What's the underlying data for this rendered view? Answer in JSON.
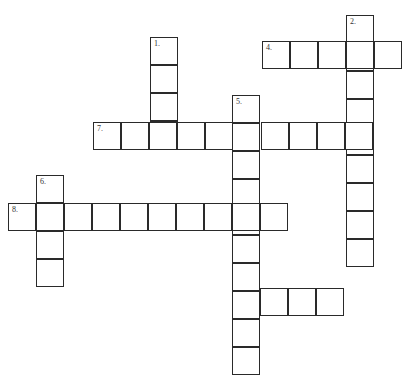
{
  "puzzle": {
    "type": "crossword",
    "cell_size": 28,
    "entries": [
      {
        "number": "1.",
        "direction": "down",
        "x": 150,
        "y": 37,
        "length": 4
      },
      {
        "number": "2.",
        "direction": "down",
        "x": 346,
        "y": 15,
        "length": 9
      },
      {
        "number": "3.",
        "direction": "across",
        "x": 232,
        "y": 288,
        "length": 4
      },
      {
        "number": "4.",
        "direction": "across",
        "x": 262,
        "y": 41,
        "length": 5
      },
      {
        "number": "5.",
        "direction": "down",
        "x": 232,
        "y": 95,
        "length": 10
      },
      {
        "number": "6.",
        "direction": "down",
        "x": 36,
        "y": 175,
        "length": 4
      },
      {
        "number": "7.",
        "direction": "across",
        "x": 93,
        "y": 122,
        "length": 10
      },
      {
        "number": "8.",
        "direction": "across",
        "x": 8,
        "y": 203,
        "length": 10
      }
    ]
  }
}
